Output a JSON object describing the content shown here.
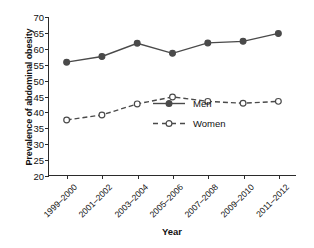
{
  "chart_data": {
    "type": "line",
    "title": "",
    "xlabel": "Year",
    "ylabel": "Prevalence of abdominal obesity",
    "categories": [
      "1999–2000",
      "2001–2002",
      "2003–2004",
      "2005–2006",
      "2007–2008",
      "2009–2010",
      "2011–2012"
    ],
    "series": [
      {
        "name": "Men",
        "values": [
          55.7,
          57.5,
          61.7,
          58.5,
          61.8,
          62.3,
          64.8
        ],
        "line_style": "solid",
        "marker": "filled-circle",
        "color": "#4a4a4a"
      },
      {
        "name": "Women",
        "values": [
          37.4,
          39.0,
          42.5,
          44.7,
          43.3,
          42.7,
          43.3
        ],
        "line_style": "dashed",
        "marker": "open-circle",
        "color": "#4a4a4a"
      }
    ],
    "ylim": [
      20,
      70
    ],
    "yticks": [
      20,
      25,
      30,
      35,
      40,
      45,
      50,
      55,
      60,
      65,
      70
    ],
    "ytick_labels": [
      "20",
      "25",
      "30",
      "35",
      "40",
      "45",
      "50",
      "55",
      "60",
      "65",
      "70"
    ],
    "grid": false,
    "legend_position": "center-right-inside",
    "axis_color": "#2b2b2b",
    "background": "#ffffff"
  }
}
